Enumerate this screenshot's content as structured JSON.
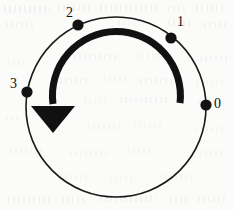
{
  "figure": {
    "kind": "circle-rotation-diagram",
    "width": 234,
    "height": 210,
    "background_color": "#fbfbfa",
    "ink_color": "#121212"
  },
  "circle": {
    "center_x": 116,
    "center_y": 107,
    "radius": 90,
    "stroke_width": 1.6,
    "stroke_color": "#1a1a1a"
  },
  "points": [
    {
      "label": "0",
      "angle_deg": 0,
      "dot_x": 206,
      "dot_y": 105,
      "dot_radius": 5.6,
      "label_x": 214,
      "label_y": 97
    },
    {
      "label": "1",
      "angle_deg": 53,
      "dot_x": 171,
      "dot_y": 38,
      "dot_radius": 5.6,
      "label_x": 177,
      "label_y": 15
    },
    {
      "label": "2",
      "angle_deg": 115,
      "dot_x": 78,
      "dot_y": 25,
      "dot_radius": 5.6,
      "label_x": 66,
      "label_y": 6
    },
    {
      "label": "3",
      "angle_deg": 170,
      "dot_x": 27,
      "dot_y": 92,
      "dot_radius": 5.6,
      "label_x": 10,
      "label_y": 77
    }
  ],
  "rotation_arrow": {
    "direction": "counterclockwise",
    "arc_radius": 64,
    "arc_stroke_width": 7,
    "arc_color": "#111111",
    "arc_start_angle_deg": 3,
    "arc_end_angle_deg": 186,
    "arc_path": "M 180 103 A 64 64 0 1 0 53 104",
    "arrowhead_points": "31,106 75,106 53,133",
    "arrowhead_color": "#111111"
  },
  "paper_marks": [
    {
      "x": 4,
      "y": 6,
      "w": 46,
      "h": 7,
      "o": 0.15
    },
    {
      "x": 58,
      "y": 5,
      "w": 34,
      "h": 6,
      "o": 0.12
    },
    {
      "x": 100,
      "y": 4,
      "w": 60,
      "h": 7,
      "o": 0.13
    },
    {
      "x": 168,
      "y": 6,
      "w": 20,
      "h": 6,
      "o": 0.11
    },
    {
      "x": 196,
      "y": 5,
      "w": 30,
      "h": 6,
      "o": 0.12
    },
    {
      "x": 6,
      "y": 22,
      "w": 30,
      "h": 6,
      "o": 0.1
    },
    {
      "x": 118,
      "y": 20,
      "w": 26,
      "h": 6,
      "o": 0.09
    },
    {
      "x": 168,
      "y": 19,
      "w": 22,
      "h": 7,
      "o": 0.13
    },
    {
      "x": 204,
      "y": 22,
      "w": 24,
      "h": 6,
      "o": 0.1
    },
    {
      "x": 74,
      "y": 54,
      "w": 44,
      "h": 6,
      "o": 0.1
    },
    {
      "x": 132,
      "y": 53,
      "w": 34,
      "h": 6,
      "o": 0.09
    },
    {
      "x": 200,
      "y": 56,
      "w": 28,
      "h": 6,
      "o": 0.1
    },
    {
      "x": 8,
      "y": 60,
      "w": 16,
      "h": 6,
      "o": 0.09
    },
    {
      "x": 60,
      "y": 78,
      "w": 30,
      "h": 6,
      "o": 0.1
    },
    {
      "x": 104,
      "y": 76,
      "w": 22,
      "h": 6,
      "o": 0.09
    },
    {
      "x": 140,
      "y": 78,
      "w": 40,
      "h": 6,
      "o": 0.1
    },
    {
      "x": 196,
      "y": 80,
      "w": 30,
      "h": 6,
      "o": 0.09
    },
    {
      "x": 84,
      "y": 98,
      "w": 22,
      "h": 6,
      "o": 0.08
    },
    {
      "x": 120,
      "y": 97,
      "w": 48,
      "h": 6,
      "o": 0.1
    },
    {
      "x": 198,
      "y": 100,
      "w": 30,
      "h": 6,
      "o": 0.09
    },
    {
      "x": 6,
      "y": 116,
      "w": 14,
      "h": 6,
      "o": 0.08
    },
    {
      "x": 88,
      "y": 124,
      "w": 36,
      "h": 6,
      "o": 0.09
    },
    {
      "x": 134,
      "y": 122,
      "w": 30,
      "h": 6,
      "o": 0.09
    },
    {
      "x": 196,
      "y": 126,
      "w": 30,
      "h": 6,
      "o": 0.09
    },
    {
      "x": 10,
      "y": 148,
      "w": 34,
      "h": 6,
      "o": 0.09
    },
    {
      "x": 70,
      "y": 150,
      "w": 40,
      "h": 6,
      "o": 0.09
    },
    {
      "x": 128,
      "y": 148,
      "w": 26,
      "h": 6,
      "o": 0.08
    },
    {
      "x": 200,
      "y": 150,
      "w": 26,
      "h": 6,
      "o": 0.09
    },
    {
      "x": 60,
      "y": 174,
      "w": 30,
      "h": 6,
      "o": 0.08
    },
    {
      "x": 110,
      "y": 176,
      "w": 22,
      "h": 6,
      "o": 0.08
    },
    {
      "x": 160,
      "y": 174,
      "w": 36,
      "h": 6,
      "o": 0.09
    },
    {
      "x": 8,
      "y": 196,
      "w": 44,
      "h": 7,
      "o": 0.12
    },
    {
      "x": 62,
      "y": 197,
      "w": 24,
      "h": 6,
      "o": 0.1
    },
    {
      "x": 100,
      "y": 195,
      "w": 56,
      "h": 7,
      "o": 0.12
    },
    {
      "x": 170,
      "y": 197,
      "w": 18,
      "h": 6,
      "o": 0.1
    },
    {
      "x": 198,
      "y": 196,
      "w": 28,
      "h": 6,
      "o": 0.11
    }
  ]
}
